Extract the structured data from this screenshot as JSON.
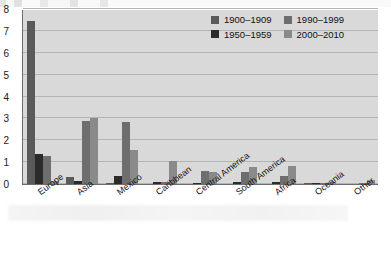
{
  "chart_data": {
    "type": "bar",
    "title": "",
    "subtitle": "",
    "xlabel": "",
    "ylabel": "",
    "ylim": [
      0,
      8
    ],
    "yticks": [
      0,
      1,
      2,
      3,
      4,
      5,
      6,
      7,
      8
    ],
    "grid": true,
    "legend_position": "top-right",
    "categories": [
      "Europe",
      "Asia",
      "Mexico",
      "Caribbean",
      "Central America",
      "South America",
      "Africa",
      "Oceania",
      "Other"
    ],
    "series": [
      {
        "name": "1900–1909",
        "color": "#5a5a5a",
        "values": [
          7.45,
          0.3,
          0.02,
          0.0,
          0.0,
          0.0,
          0.0,
          0.03,
          0.0
        ]
      },
      {
        "name": "1950–1959",
        "color": "#2b2b2b",
        "values": [
          1.38,
          0.12,
          0.35,
          0.08,
          0.04,
          0.08,
          0.08,
          0.01,
          0.0
        ]
      },
      {
        "name": "1990–1999",
        "color": "#6e6e6e",
        "values": [
          1.28,
          2.86,
          2.85,
          0.1,
          0.61,
          0.57,
          0.35,
          0.06,
          0.02
        ]
      },
      {
        "name": "2000–2010",
        "color": "#8a8a8a",
        "values": [
          0.14,
          3.0,
          1.56,
          1.06,
          0.57,
          0.79,
          0.82,
          0.07,
          0.18
        ]
      }
    ]
  },
  "legend": {
    "entries": [
      {
        "label": "1900–1909",
        "color": "#5a5a5a"
      },
      {
        "label": "1990–1999",
        "color": "#6e6e6e"
      },
      {
        "label": "1950–1959",
        "color": "#2b2b2b"
      },
      {
        "label": "2000–2010",
        "color": "#8a8a8a"
      }
    ]
  },
  "axes": {
    "y_tick_labels": [
      "8",
      "7",
      "6",
      "5",
      "4",
      "3",
      "2",
      "1",
      "0"
    ]
  },
  "colors": {
    "plot_background": "#d9d9d9",
    "gridline": "#b4b4b4",
    "axis_line": "#6d6d6d",
    "text": "#131313"
  }
}
